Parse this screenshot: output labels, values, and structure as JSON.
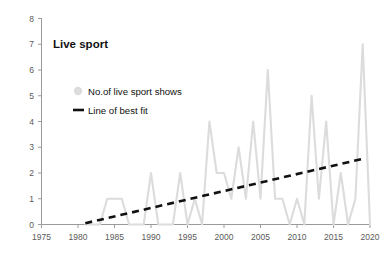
{
  "chart_data": {
    "type": "line",
    "title": "Live sport",
    "xlabel": "",
    "ylabel": "",
    "xlim": [
      1975,
      2020
    ],
    "ylim": [
      0,
      8
    ],
    "grid": false,
    "legend_position": "top-left-inside",
    "x_ticks": [
      "1975",
      "1980",
      "1985",
      "1990",
      "1995",
      "2000",
      "2005",
      "2010",
      "2015",
      "2020"
    ],
    "y_ticks": [
      "0",
      "1",
      "2",
      "3",
      "4",
      "5",
      "6",
      "7",
      "8"
    ],
    "series": [
      {
        "name": "No.of live sport shows",
        "type": "line",
        "color": "#dcdcdc",
        "marker": "circle",
        "x": [
          1981,
          1982,
          1983,
          1984,
          1985,
          1986,
          1987,
          1988,
          1989,
          1990,
          1991,
          1992,
          1993,
          1994,
          1995,
          1996,
          1997,
          1998,
          1999,
          2000,
          2001,
          2002,
          2003,
          2004,
          2005,
          2006,
          2007,
          2008,
          2009,
          2010,
          2011,
          2012,
          2013,
          2014,
          2015,
          2016,
          2017,
          2018,
          2019,
          2020
        ],
        "values": [
          0,
          0,
          0,
          1,
          1,
          1,
          0,
          0,
          0,
          2,
          0,
          0,
          0,
          2,
          0,
          1,
          0,
          4,
          2,
          2,
          1,
          3,
          1,
          4,
          1,
          6,
          1,
          1,
          0,
          1,
          0,
          5,
          1,
          4,
          0,
          2,
          0,
          1,
          7,
          0
        ]
      },
      {
        "name": "Line of best fit",
        "type": "line",
        "style": "dashed",
        "color": "#111111",
        "x": [
          1981,
          2019
        ],
        "values": [
          0.05,
          2.55
        ]
      }
    ],
    "legend": [
      {
        "label": "No.of live sport shows",
        "marker": "circle",
        "color": "#dcdcdc"
      },
      {
        "label": "Line of best fit",
        "marker": "dash",
        "color": "#111111"
      }
    ]
  },
  "colors": {
    "series_gray": "#dcdcdc",
    "fit_black": "#111111",
    "axis_gray": "#9a9a9a",
    "tick_text": "#5a5a5a",
    "background": "#ffffff"
  }
}
